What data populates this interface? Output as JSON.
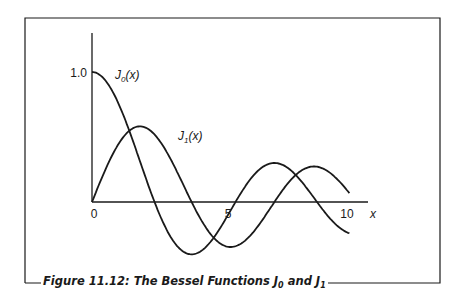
{
  "figure": {
    "caption_prefix": "Figure 11.12: The Bessel Functions J",
    "caption_sub0": "0",
    "caption_mid": " and J",
    "caption_sub1": "1"
  },
  "colors": {
    "line": "#1a1a1a",
    "background": "#ffffff"
  },
  "chart_data": {
    "type": "line",
    "title": "Figure 11.12: The Bessel Functions J0 and J1",
    "xlabel": "x",
    "ylabel": "",
    "xlim": [
      0,
      10
    ],
    "ylim": [
      -0.45,
      1.2
    ],
    "x_ticks": [
      "0",
      "5",
      "10"
    ],
    "y_ticks": [
      "1.0"
    ],
    "grid": false,
    "legend": "inline labels",
    "series": [
      {
        "name": "J0(x)",
        "label": "J",
        "label_sub": "0",
        "label_suffix": "(x)",
        "x": [
          0,
          1,
          2,
          2.405,
          3,
          3.832,
          4,
          5,
          5.52,
          6,
          7,
          7.016,
          8,
          8.654,
          9,
          9.9
        ],
        "values": [
          1.0,
          0.765,
          0.224,
          0.0,
          -0.26,
          -0.403,
          -0.397,
          -0.178,
          0.0,
          0.151,
          0.3,
          0.3,
          0.172,
          0.0,
          -0.09,
          -0.26
        ]
      },
      {
        "name": "J1(x)",
        "label": "J",
        "label_sub": "1",
        "label_suffix": "(x)",
        "x": [
          0,
          1,
          1.841,
          2,
          3,
          3.832,
          4,
          5,
          5.331,
          6,
          7,
          7.016,
          8,
          8.536,
          9,
          9.9
        ],
        "values": [
          0.0,
          0.44,
          0.582,
          0.577,
          0.339,
          0.0,
          -0.066,
          -0.328,
          -0.346,
          -0.277,
          -0.005,
          0.0,
          0.235,
          0.273,
          0.245,
          0.05
        ]
      }
    ]
  }
}
